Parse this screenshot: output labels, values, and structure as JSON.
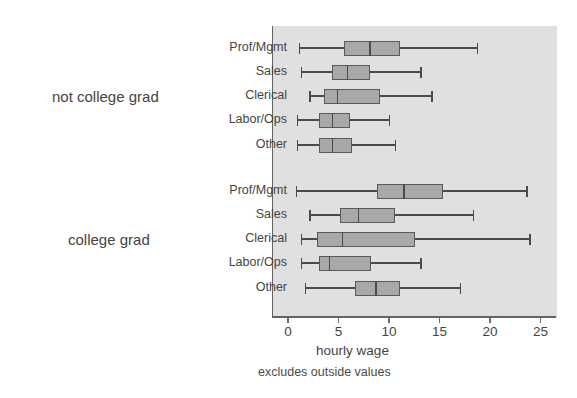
{
  "chart_data": {
    "type": "box",
    "title": "",
    "xlabel": "hourly wage",
    "ylabel": "",
    "note": "excludes outside values",
    "xlim": [
      0,
      26.3
    ],
    "xticks": [
      0,
      5,
      10,
      15,
      20,
      25
    ],
    "xtick_labels": [
      "0",
      "5",
      "10",
      "15",
      "20",
      "25"
    ],
    "grid": false,
    "legend": "none",
    "orientation": "horizontal",
    "plot_bg_color": "#e0e0e0",
    "box_fill_color": "#a8a8a8",
    "box_edge_color": "#5a5a5a",
    "groups": [
      {
        "label": "not college grad",
        "categories": [
          {
            "label": "Prof/Mgmt",
            "whisker_low": 1.1,
            "q1": 5.5,
            "median": 8.1,
            "q3": 11.1,
            "whisker_high": 18.7
          },
          {
            "label": "Sales",
            "whisker_low": 1.3,
            "q1": 4.4,
            "median": 5.9,
            "q3": 8.1,
            "whisker_high": 13.1
          },
          {
            "label": "Clerical",
            "whisker_low": 2.1,
            "q1": 3.6,
            "median": 4.9,
            "q3": 9.1,
            "whisker_high": 14.2
          },
          {
            "label": "Labor/Ops",
            "whisker_low": 0.9,
            "q1": 3.1,
            "median": 4.4,
            "q3": 6.1,
            "whisker_high": 10.0
          },
          {
            "label": "Other",
            "whisker_low": 0.9,
            "q1": 3.1,
            "median": 4.4,
            "q3": 6.3,
            "whisker_high": 10.6
          }
        ]
      },
      {
        "label": "college grad",
        "categories": [
          {
            "label": "Prof/Mgmt",
            "whisker_low": 0.8,
            "q1": 8.8,
            "median": 11.5,
            "q3": 15.3,
            "whisker_high": 23.6
          },
          {
            "label": "Sales",
            "whisker_low": 2.1,
            "q1": 5.1,
            "median": 7.0,
            "q3": 10.6,
            "whisker_high": 18.3
          },
          {
            "label": "Clerical",
            "whisker_low": 1.3,
            "q1": 2.9,
            "median": 5.4,
            "q3": 12.6,
            "whisker_high": 23.9
          },
          {
            "label": "Labor/Ops",
            "whisker_low": 1.3,
            "q1": 3.1,
            "median": 4.1,
            "q3": 8.2,
            "whisker_high": 13.1
          },
          {
            "label": "Other",
            "whisker_low": 1.7,
            "q1": 6.6,
            "median": 8.7,
            "q3": 11.1,
            "whisker_high": 17.0
          }
        ]
      }
    ]
  }
}
